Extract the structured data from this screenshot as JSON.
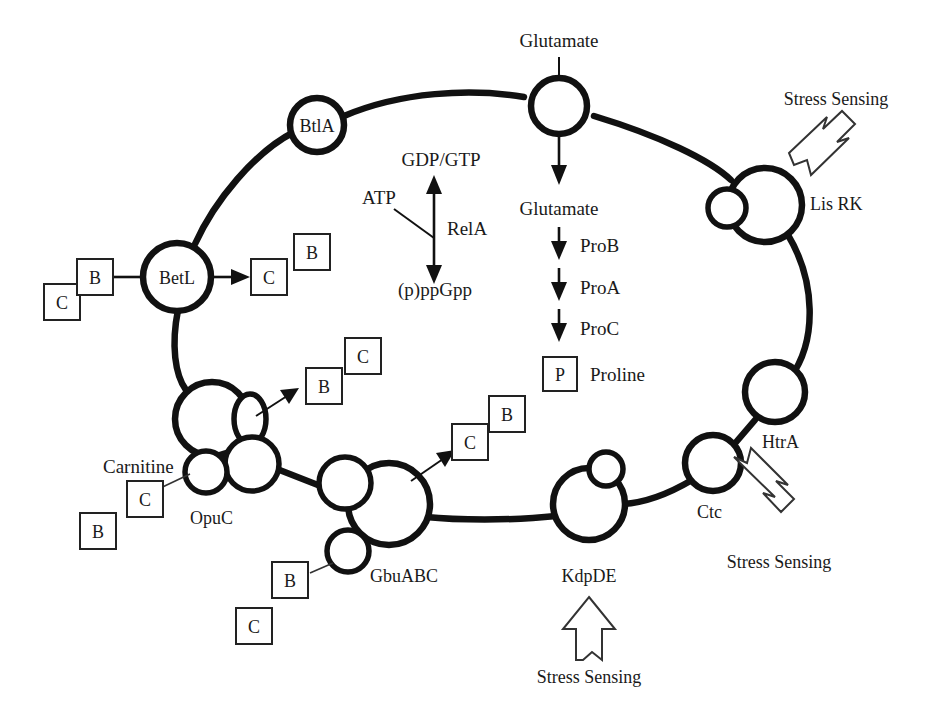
{
  "figure": {
    "type": "biological-pathway-diagram"
  },
  "membrane_proteins": [
    {
      "id": "btla",
      "label": "BtlA"
    },
    {
      "id": "glut_transporter",
      "label": ""
    },
    {
      "id": "lisrk",
      "label": "Lis RK"
    },
    {
      "id": "htra",
      "label": "HtrA"
    },
    {
      "id": "ctc",
      "label": "Ctc"
    },
    {
      "id": "kdpde",
      "label": "KdpDE"
    },
    {
      "id": "gbuabc",
      "label": "GbuABC"
    },
    {
      "id": "opuc",
      "label": "OpuC"
    },
    {
      "id": "betl",
      "label": "BetL"
    }
  ],
  "external_labels": {
    "glutamate_out": "Glutamate",
    "glutamate_in": "Glutamate",
    "carnitine": "Carnitine"
  },
  "rela_pathway": {
    "substrate": "ATP",
    "product_top": "GDP/GTP",
    "product_bottom": "(p)ppGpp",
    "enzyme": "RelA"
  },
  "proline_pathway": {
    "start": "Glutamate",
    "steps": [
      "ProB",
      "ProA",
      "ProC"
    ],
    "product_tag": "P",
    "product": "Proline"
  },
  "stress_sensing": [
    {
      "id": "lisrk-stress",
      "label": "Stress Sensing"
    },
    {
      "id": "ctc-stress",
      "label": "Stress Sensing"
    },
    {
      "id": "kdpde-stress",
      "label": "Stress Sensing"
    }
  ],
  "molecule_boxes": [
    {
      "id": "betl-c-out",
      "label": "C"
    },
    {
      "id": "betl-b-out",
      "label": "B"
    },
    {
      "id": "betl-c-in",
      "label": "C"
    },
    {
      "id": "betl-b-in",
      "label": "B"
    },
    {
      "id": "opuc-b-out",
      "label": "B"
    },
    {
      "id": "opuc-c-out",
      "label": "C"
    },
    {
      "id": "opuc-b-in",
      "label": "B"
    },
    {
      "id": "opuc-c-in",
      "label": "C"
    },
    {
      "id": "gbu-c-out",
      "label": "C"
    },
    {
      "id": "gbu-b-out",
      "label": "B"
    },
    {
      "id": "gbu-b-in",
      "label": "B"
    },
    {
      "id": "gbu-c-in",
      "label": "C"
    }
  ],
  "colors": {
    "ink": "#111111",
    "background": "#ffffff",
    "box_stroke": "#222222"
  }
}
